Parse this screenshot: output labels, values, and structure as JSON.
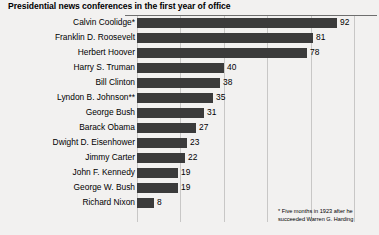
{
  "chart_data": {
    "type": "bar",
    "orientation": "horizontal",
    "title": "Presidential news conferences in the first year of office",
    "xlabel": "",
    "ylabel": "",
    "xlim": [
      0,
      110
    ],
    "grid": true,
    "gridlines_every": 20,
    "legend": "none",
    "bar_color": "#3b3b3b",
    "background_color": "#f2f1f0",
    "gridline_color": "#c8c7c6",
    "categories": [
      "Calvin Coolidge*",
      "Franklin D. Roosevelt",
      "Herbert Hoover",
      "Harry S. Truman",
      "Bill Clinton",
      "Lyndon B. Johnson**",
      "George Bush",
      "Barack Obama",
      "Dwight D. Eisenhower",
      "Jimmy Carter",
      "John F. Kennedy",
      "George W. Bush",
      "Richard Nixon"
    ],
    "values": [
      92,
      81,
      78,
      40,
      38,
      35,
      31,
      27,
      23,
      22,
      19,
      19,
      8
    ],
    "annotations": [
      "* Five months in 1923 after he succeeded Warren G. Harding"
    ]
  },
  "footnote": {
    "line1": "* Five months in 1923 after he",
    "line2": "succeeded Warren G. Harding"
  }
}
